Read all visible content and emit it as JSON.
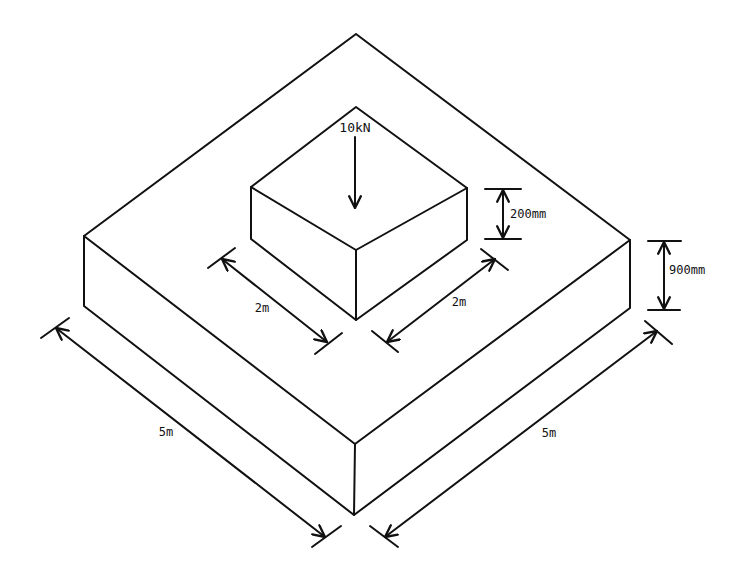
{
  "diagram": {
    "colors": {
      "line": "#111111",
      "background": "#ffffff"
    },
    "footing": {
      "name": "footing-slab",
      "width_label": "5m",
      "depth_label": "5m",
      "thickness_label": "900mm"
    },
    "pedestal": {
      "name": "column-pedestal",
      "width_label": "2m",
      "depth_label": "2m",
      "height_label": "200mm"
    },
    "load": {
      "label": "10kN",
      "direction": "down"
    }
  }
}
